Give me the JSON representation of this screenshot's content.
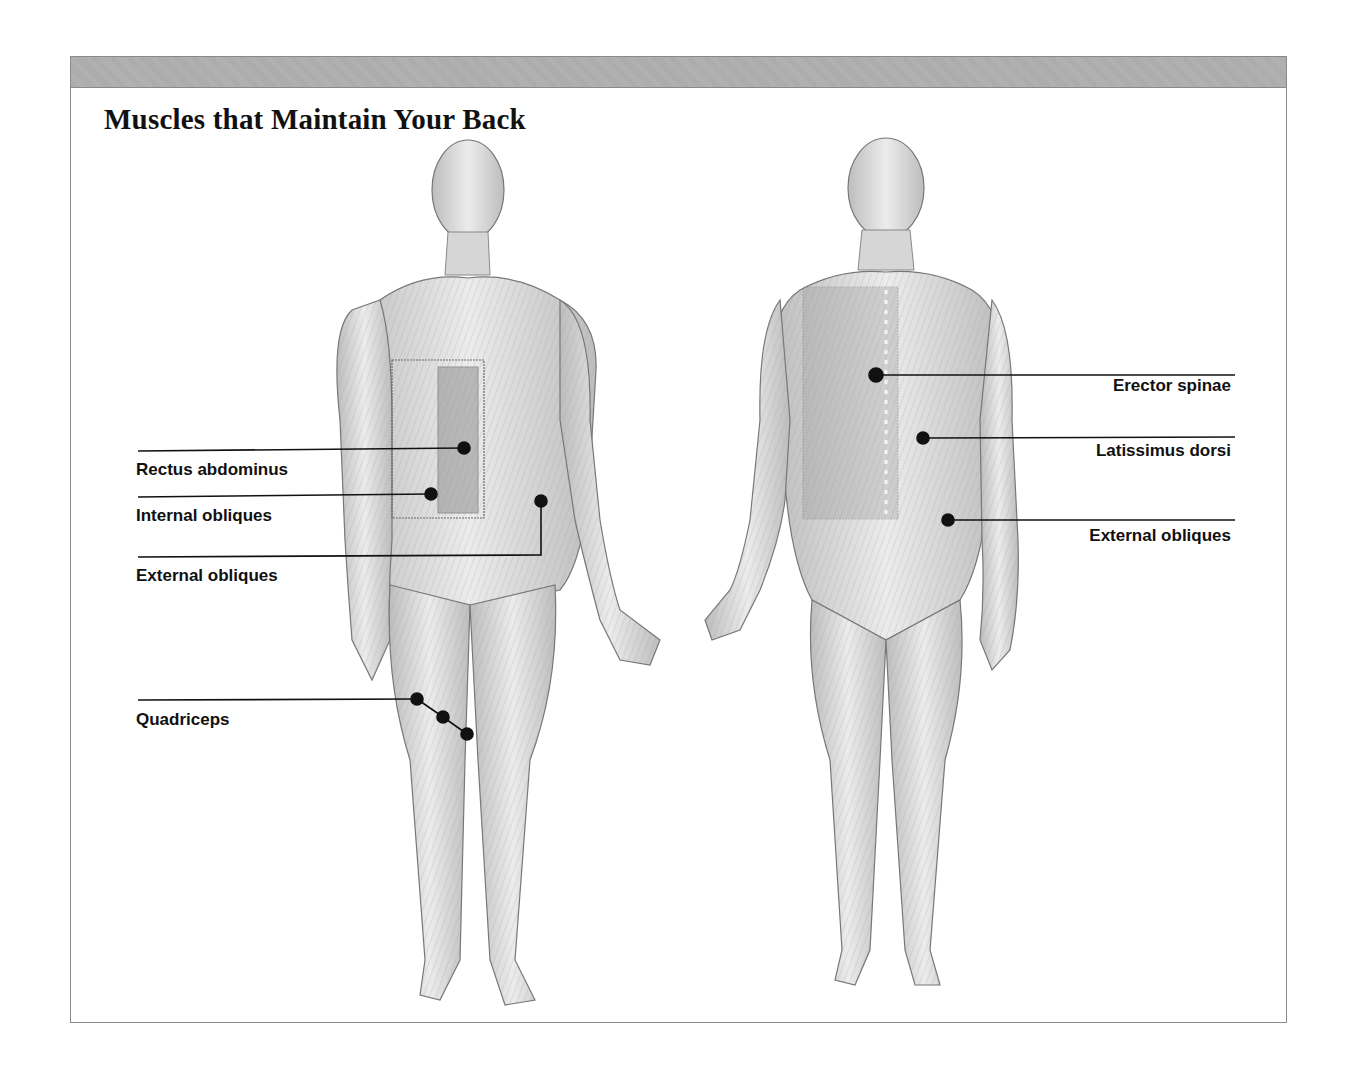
{
  "title": "Muscles that Maintain Your Back",
  "figures": {
    "front": {
      "view": "anterior",
      "highlight_box": "abdominal region"
    },
    "back": {
      "view": "posterior",
      "highlight_box": "upper back / spine region"
    }
  },
  "labels": {
    "front": [
      {
        "text": "Rectus abdominus",
        "x": 136,
        "y": 460
      },
      {
        "text": "Internal obliques",
        "x": 136,
        "y": 506
      },
      {
        "text": "External obliques",
        "x": 136,
        "y": 566
      },
      {
        "text": "Quadriceps",
        "x": 136,
        "y": 710
      }
    ],
    "back": [
      {
        "text": "Erector spinae",
        "right": 1231,
        "y": 376
      },
      {
        "text": "Latissimus dorsi",
        "right": 1231,
        "y": 441
      },
      {
        "text": "External obliques",
        "right": 1231,
        "y": 526
      }
    ]
  },
  "colors": {
    "header_bar": "#b0b0b0",
    "frame_border": "#8a8a8a",
    "leader_line": "#111111",
    "skin_tone": "#d8d8d8"
  }
}
